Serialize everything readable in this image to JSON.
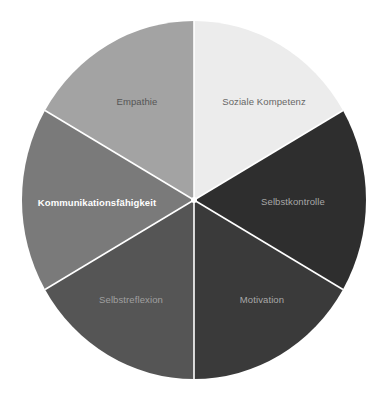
{
  "chart_data": {
    "type": "pie",
    "title": "",
    "start_angle_deg": 0,
    "direction": "clockwise",
    "center": [
      194,
      200
    ],
    "radius": [
      172,
      179
    ],
    "separator_color": "#ffffff",
    "slices": [
      {
        "label": "Soziale Kompetenz",
        "value": 1,
        "color": "#ececec",
        "label_color": "#666666",
        "label_pos": [
          264,
          102
        ],
        "bold": false
      },
      {
        "label": "Selbstkontrolle",
        "value": 1,
        "color": "#2e2e2e",
        "label_color": "#a8a8a8",
        "label_pos": [
          293,
          202
        ],
        "bold": false
      },
      {
        "label": "Motivation",
        "value": 1,
        "color": "#3a3a3a",
        "label_color": "#a8a8a8",
        "label_pos": [
          262,
          300
        ],
        "bold": false
      },
      {
        "label": "Selbstreflexion",
        "value": 1,
        "color": "#555555",
        "label_color": "#a0a0a0",
        "label_pos": [
          131,
          300
        ],
        "bold": false
      },
      {
        "label": "Kommunikationsfähigkeit",
        "value": 1,
        "color": "#7a7a7a",
        "label_color": "#ffffff",
        "label_pos": [
          97,
          203
        ],
        "bold": true
      },
      {
        "label": "Empathie",
        "value": 1,
        "color": "#a3a3a3",
        "label_color": "#555555",
        "label_pos": [
          137,
          102
        ],
        "bold": false
      }
    ],
    "legend": null
  }
}
